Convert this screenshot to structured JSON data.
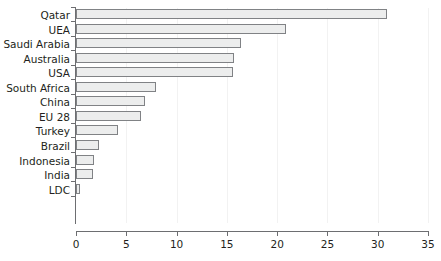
{
  "chart_data": {
    "type": "bar",
    "orientation": "horizontal",
    "title": "",
    "xlabel": "",
    "ylabel": "",
    "xlim": [
      0,
      35
    ],
    "xticks": [
      0,
      5,
      10,
      15,
      20,
      25,
      30,
      35
    ],
    "grid": "vertical-only",
    "legend": "none",
    "bar_fill_color": "#eceded",
    "bar_border_color": "#808285",
    "axis_color": "#6d6e71",
    "text_color": "#231f20",
    "categories": [
      "Qatar",
      "UEA",
      "Saudi Arabia",
      "Australia",
      "USA",
      "South Africa",
      "China",
      "EU 28",
      "Turkey",
      "Brazil",
      "Indonesia",
      "India",
      "LDC"
    ],
    "values": [
      30.9,
      20.9,
      16.4,
      15.7,
      15.6,
      8.0,
      6.9,
      6.5,
      4.2,
      2.3,
      1.8,
      1.7,
      0.35
    ]
  }
}
